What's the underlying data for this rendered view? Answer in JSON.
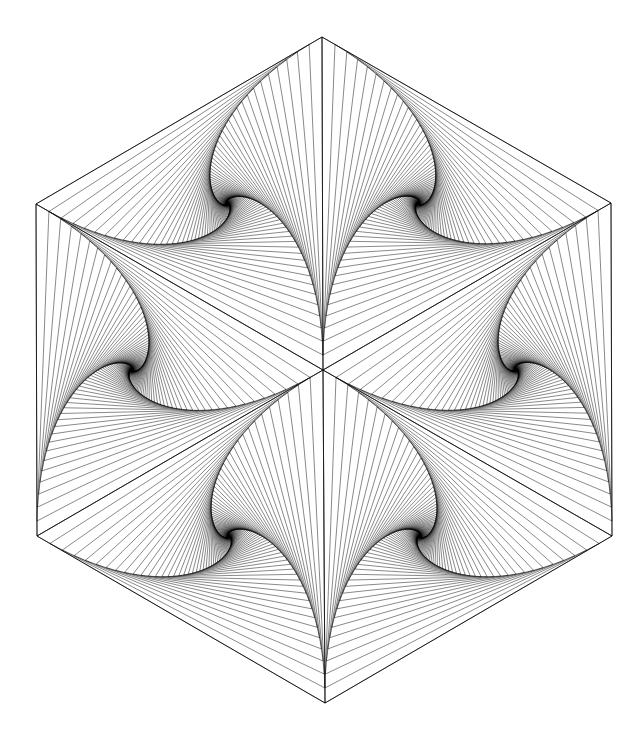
{
  "artwork": {
    "title": "Hexagonal string-art whirl pattern",
    "stroke_color": "#000000",
    "background_color": "#ffffff",
    "canvas": {
      "width": 644,
      "height": 738
    },
    "hexagon": {
      "center": [
        323,
        370
      ],
      "vertices": [
        [
          322,
          37
        ],
        [
          611,
          203
        ],
        [
          612,
          536
        ],
        [
          325,
          703
        ],
        [
          37,
          536
        ],
        [
          36,
          204
        ]
      ]
    },
    "whirl": {
      "triangles": 6,
      "step_ratio": 0.045,
      "iterations": 160,
      "alternate_direction": true,
      "vortex_points": [
        [
          227,
          204
        ],
        [
          418,
          205
        ],
        [
          515,
          370
        ],
        [
          420,
          536
        ],
        [
          228,
          537
        ],
        [
          132,
          370
        ]
      ]
    }
  }
}
